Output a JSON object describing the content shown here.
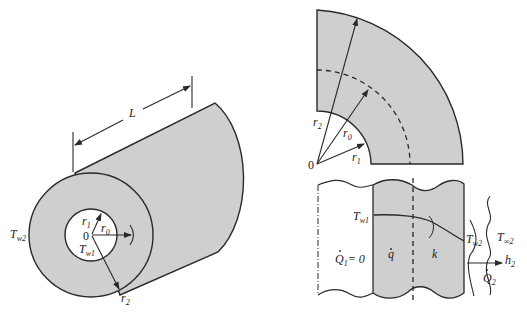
{
  "diagram": {
    "colors": {
      "fill": "#cfcfcf",
      "stroke": "#2a2a2a",
      "background": "#ffffff"
    },
    "cylinder_view": {
      "length_label": "L",
      "outer_temp_label": {
        "main": "T",
        "sub": "w2"
      },
      "inner_temp_label": {
        "main": "T",
        "sub": "w1"
      },
      "r1_label": {
        "main": "r",
        "sub": "1"
      },
      "r0_label": {
        "main": "r",
        "sub": "0"
      },
      "r2_label": {
        "main": "r",
        "sub": "2"
      },
      "origin_label": "0"
    },
    "quarter_section": {
      "r2_label": {
        "main": "r",
        "sub": "2"
      },
      "r0_label": {
        "main": "r",
        "sub": "0"
      },
      "r1_label": {
        "main": "r",
        "sub": "1"
      },
      "origin_label": "0"
    },
    "wall_profile": {
      "tw1_label": {
        "main": "T",
        "sub": "w1"
      },
      "tw2_label": {
        "main": "T",
        "sub": "w2"
      },
      "tinf_label": {
        "main": "T",
        "sub": "∞2"
      },
      "q1_label": {
        "main": "Q",
        "sub": "1",
        "suffix": "= 0"
      },
      "qgen_label": "q",
      "k_label": "k",
      "h2_label": {
        "main": "h",
        "sub": "2"
      },
      "q2_label": {
        "main": "Q",
        "sub": "2"
      }
    }
  }
}
